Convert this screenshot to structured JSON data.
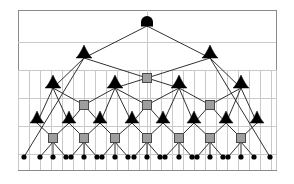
{
  "figure": {
    "type": "tree-diagram",
    "width": 294,
    "height": 184
  },
  "colors": {
    "background": "#ffffff",
    "grid_line": "#c9c9c9",
    "border": "#8a8a8a",
    "edge_line": "#1a1a1a",
    "node_black": "#000000",
    "node_gray_fill": "#9e9e9e",
    "node_gray_stroke": "#4a4a4a"
  },
  "panel": {
    "x": 18,
    "y": 10,
    "width": 258,
    "height": 160,
    "horizontal_rules_y": [
      42,
      70,
      98,
      126,
      154
    ],
    "vertical_rules_top_y": 70,
    "vertical_rules_bottom_y": 170,
    "vertical_rules_x": [
      18,
      29,
      40,
      51,
      62,
      73,
      84,
      95,
      106,
      117,
      128,
      139,
      150,
      161,
      172,
      183,
      194,
      205,
      216,
      227,
      238,
      249,
      260,
      271,
      276
    ],
    "center_rule_x": 147,
    "center_rule_from_y": 10,
    "center_rule_to_y": 170
  },
  "nodes": {
    "root": {
      "label": "root-dome-node",
      "shape": "dome",
      "x": 147,
      "y": 22,
      "radius": 6,
      "fill": "#000000"
    },
    "level2_triangles": {
      "label": "level-2-triangle-node",
      "shape": "triangle",
      "y": 58,
      "half_width": 8,
      "height": 13,
      "fill": "#000000",
      "x_positions": [
        84,
        210
      ]
    },
    "level2_square": {
      "label": "level-2-square-node",
      "shape": "square",
      "y": 78,
      "size": 9,
      "x_positions": [
        147
      ]
    },
    "level3_triangles": {
      "label": "level-3-triangle-node",
      "shape": "triangle",
      "y": 88,
      "half_width": 8,
      "height": 13,
      "fill": "#000000",
      "x_positions": [
        53,
        115,
        179,
        241
      ]
    },
    "level3_squares": {
      "label": "level-3-square-node",
      "shape": "square",
      "y": 105,
      "size": 9,
      "x_positions": [
        84,
        147,
        210
      ]
    },
    "level4_triangles": {
      "label": "level-4-triangle-node",
      "shape": "triangle",
      "y": 123,
      "half_width": 7,
      "height": 12,
      "fill": "#000000",
      "x_positions": [
        37,
        69,
        100,
        132,
        163,
        194,
        226,
        257
      ]
    },
    "level4_squares": {
      "label": "level-4-square-node",
      "shape": "square",
      "y": 138,
      "size": 9,
      "x_positions": [
        53,
        84,
        115,
        147,
        179,
        210,
        241
      ]
    },
    "leaves": {
      "label": "leaf-node",
      "shape": "dot",
      "y": 157,
      "radius": 2.6,
      "fill": "#000000",
      "x_positions": [
        24,
        40,
        53,
        66,
        71,
        84,
        97,
        102,
        115,
        128,
        134,
        147,
        160,
        165,
        179,
        192,
        197,
        210,
        223,
        228,
        241,
        254,
        270
      ]
    }
  },
  "edges": {
    "root_to_level2": [
      {
        "from": [
          147,
          26
        ],
        "to": [
          84,
          58
        ]
      },
      {
        "from": [
          147,
          26
        ],
        "to": [
          210,
          58
        ]
      }
    ],
    "level2_to_square": [
      {
        "from": [
          84,
          58
        ],
        "to": [
          147,
          78
        ]
      },
      {
        "from": [
          210,
          58
        ],
        "to": [
          147,
          78
        ]
      }
    ],
    "level2_long_left": [
      {
        "from": [
          84,
          58
        ],
        "to": [
          24,
          157
        ]
      }
    ],
    "level2_long_right": [
      {
        "from": [
          210,
          58
        ],
        "to": [
          270,
          157
        ]
      }
    ],
    "level2_to_level3": [
      {
        "from": [
          84,
          58
        ],
        "to": [
          53,
          88
        ]
      },
      {
        "from": [
          210,
          58
        ],
        "to": [
          241,
          88
        ]
      }
    ],
    "square2_to_level3": [
      {
        "from": [
          147,
          78
        ],
        "to": [
          115,
          88
        ]
      },
      {
        "from": [
          147,
          78
        ],
        "to": [
          179,
          88
        ]
      }
    ],
    "level3_to_squares": [
      {
        "from": [
          53,
          88
        ],
        "to": [
          84,
          105
        ]
      },
      {
        "from": [
          115,
          88
        ],
        "to": [
          84,
          105
        ]
      },
      {
        "from": [
          115,
          88
        ],
        "to": [
          147,
          105
        ]
      },
      {
        "from": [
          179,
          88
        ],
        "to": [
          147,
          105
        ]
      },
      {
        "from": [
          179,
          88
        ],
        "to": [
          210,
          105
        ]
      },
      {
        "from": [
          241,
          88
        ],
        "to": [
          210,
          105
        ]
      }
    ],
    "level3_to_level4": [
      {
        "from": [
          53,
          88
        ],
        "to": [
          37,
          123
        ]
      },
      {
        "from": [
          115,
          88
        ],
        "to": [
          100,
          123
        ]
      },
      {
        "from": [
          179,
          88
        ],
        "to": [
          163,
          123
        ]
      },
      {
        "from": [
          241,
          88
        ],
        "to": [
          226,
          123
        ]
      }
    ],
    "squares3_to_level4": [
      {
        "from": [
          84,
          105
        ],
        "to": [
          69,
          123
        ]
      },
      {
        "from": [
          84,
          105
        ],
        "to": [
          100,
          123
        ]
      },
      {
        "from": [
          147,
          105
        ],
        "to": [
          132,
          123
        ]
      },
      {
        "from": [
          147,
          105
        ],
        "to": [
          163,
          123
        ]
      },
      {
        "from": [
          210,
          105
        ],
        "to": [
          194,
          123
        ]
      },
      {
        "from": [
          210,
          105
        ],
        "to": [
          226,
          123
        ]
      }
    ],
    "level3_outer_to_level4": [
      {
        "from": [
          53,
          88
        ],
        "to": [
          69,
          123
        ]
      },
      {
        "from": [
          241,
          88
        ],
        "to": [
          257,
          123
        ]
      },
      {
        "from": [
          115,
          88
        ],
        "to": [
          132,
          123
        ]
      },
      {
        "from": [
          179,
          88
        ],
        "to": [
          194,
          123
        ]
      }
    ],
    "level4_to_squares": [
      {
        "from": [
          37,
          123
        ],
        "to": [
          53,
          138
        ]
      },
      {
        "from": [
          69,
          123
        ],
        "to": [
          53,
          138
        ]
      },
      {
        "from": [
          69,
          123
        ],
        "to": [
          84,
          138
        ]
      },
      {
        "from": [
          100,
          123
        ],
        "to": [
          84,
          138
        ]
      },
      {
        "from": [
          100,
          123
        ],
        "to": [
          115,
          138
        ]
      },
      {
        "from": [
          132,
          123
        ],
        "to": [
          115,
          138
        ]
      },
      {
        "from": [
          132,
          123
        ],
        "to": [
          147,
          138
        ]
      },
      {
        "from": [
          163,
          123
        ],
        "to": [
          147,
          138
        ]
      },
      {
        "from": [
          163,
          123
        ],
        "to": [
          179,
          138
        ]
      },
      {
        "from": [
          194,
          123
        ],
        "to": [
          179,
          138
        ]
      },
      {
        "from": [
          194,
          123
        ],
        "to": [
          210,
          138
        ]
      },
      {
        "from": [
          226,
          123
        ],
        "to": [
          210,
          138
        ]
      },
      {
        "from": [
          226,
          123
        ],
        "to": [
          241,
          138
        ]
      },
      {
        "from": [
          257,
          123
        ],
        "to": [
          241,
          138
        ]
      }
    ],
    "squares_to_leaves": [
      {
        "from": [
          53,
          142
        ],
        "to": [
          40,
          157
        ]
      },
      {
        "from": [
          53,
          142
        ],
        "to": [
          53,
          157
        ]
      },
      {
        "from": [
          53,
          142
        ],
        "to": [
          66,
          157
        ]
      },
      {
        "from": [
          84,
          142
        ],
        "to": [
          71,
          157
        ]
      },
      {
        "from": [
          84,
          142
        ],
        "to": [
          84,
          157
        ]
      },
      {
        "from": [
          84,
          142
        ],
        "to": [
          97,
          157
        ]
      },
      {
        "from": [
          115,
          142
        ],
        "to": [
          102,
          157
        ]
      },
      {
        "from": [
          115,
          142
        ],
        "to": [
          115,
          157
        ]
      },
      {
        "from": [
          115,
          142
        ],
        "to": [
          128,
          157
        ]
      },
      {
        "from": [
          147,
          142
        ],
        "to": [
          134,
          157
        ]
      },
      {
        "from": [
          147,
          142
        ],
        "to": [
          147,
          157
        ]
      },
      {
        "from": [
          147,
          142
        ],
        "to": [
          160,
          157
        ]
      },
      {
        "from": [
          179,
          142
        ],
        "to": [
          165,
          157
        ]
      },
      {
        "from": [
          179,
          142
        ],
        "to": [
          179,
          157
        ]
      },
      {
        "from": [
          179,
          142
        ],
        "to": [
          192,
          157
        ]
      },
      {
        "from": [
          210,
          142
        ],
        "to": [
          197,
          157
        ]
      },
      {
        "from": [
          210,
          142
        ],
        "to": [
          210,
          157
        ]
      },
      {
        "from": [
          210,
          142
        ],
        "to": [
          223,
          157
        ]
      },
      {
        "from": [
          241,
          142
        ],
        "to": [
          228,
          157
        ]
      },
      {
        "from": [
          241,
          142
        ],
        "to": [
          241,
          157
        ]
      },
      {
        "from": [
          241,
          142
        ],
        "to": [
          254,
          157
        ]
      }
    ]
  },
  "counts": {
    "root_nodes": 1,
    "triangle_nodes": 14,
    "square_nodes": 11,
    "leaf_nodes": 23,
    "levels": 5
  }
}
